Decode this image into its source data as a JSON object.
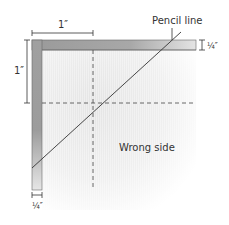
{
  "labels": {
    "pencil_line": "Pencil line",
    "wrong_side": "Wrong side",
    "dim_top": "1″",
    "dim_left": "1″",
    "dim_right": "¼″",
    "dim_bottom": "¼″"
  },
  "colors": {
    "line": "#333333",
    "bar_dark": "#8a8a8a",
    "bar_light": "#e6e6e6",
    "fabric": "#e8e8e8"
  }
}
